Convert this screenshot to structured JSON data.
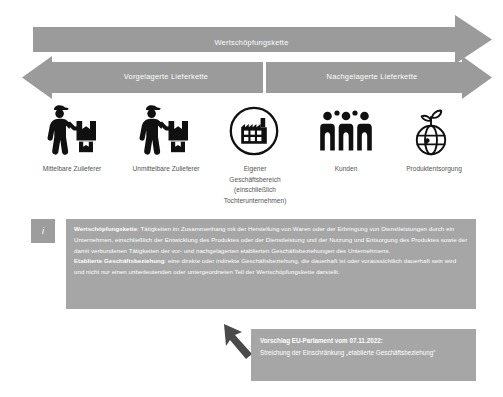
{
  "diagram": {
    "title": "Wertschöpfungskette",
    "arrows": {
      "value_chain": "Wertschöpfungskette",
      "upstream": "Vorgelagerte Lieferkette",
      "downstream": "Nachgelagerte Lieferkette"
    },
    "nodes": [
      {
        "icon": "delivery-person-icon",
        "label": "Mittelbare Zulieferer"
      },
      {
        "icon": "delivery-person-icon",
        "label": "Unmittelbare Zulieferer"
      },
      {
        "icon": "factory-in-circle-icon",
        "label": "Eigener\nGeschäftsbereich\n(einschließlich\nTochterunternehmen)"
      },
      {
        "icon": "three-people-icon",
        "label": "Kunden"
      },
      {
        "icon": "globe-sprout-icon",
        "label": "Produktentsorgung"
      }
    ],
    "info_box": {
      "badge": "i",
      "badge_icon": "info-icon",
      "definitions": [
        {
          "term": "Wertschöpfungskette",
          "separator": ": ",
          "text": "Tätigkeiten im Zusammenhang mit der Herstellung von Waren oder der Erbringung von Dienstleistungen durch ein Unternehmen, einschließlich der Entwicklung des Produktes oder der Dienstleistung und der Nutzung und Entsorgung des Produktes sowie der damit verbundenen Tätigkeiten der vor- und nachgelagerten etablierten Geschäftsbeziehungen des Unternehmens."
        },
        {
          "term": "Etablierte Geschäftsbeziehung",
          "separator": ": ",
          "text": "eine direkte oder indirekte Geschäftsbeziehung, die dauerhaft ist oder voraussichtlich dauerhaft sein wird und nicht nur einen unbedeutenden oder untergeordneten Teil der Wertschöpfungskette darstellt."
        }
      ]
    },
    "callout": {
      "icon": "callout-arrow-icon",
      "heading": "Vorschlag EU-Parlament vom 07.11.2022:",
      "body": "Streichung der Einschränkung „etablierte Geschäftsbeziehung“"
    },
    "colors": {
      "arrow_fill": "#9b9b9b",
      "panel_fill": "#a6a6a6",
      "badge_fill": "#9d9d9d",
      "icon_black": "#101010",
      "label_text": "#555555",
      "panel_text": "#ffffff",
      "background": "#ffffff"
    }
  }
}
